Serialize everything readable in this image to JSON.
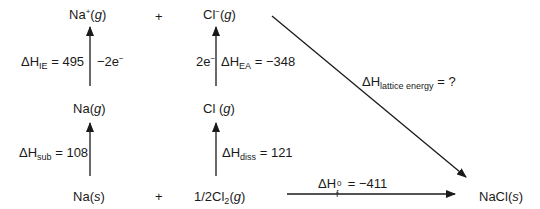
{
  "species": {
    "na_plus_g": {
      "base": "Na",
      "sup": "+",
      "state": "g"
    },
    "cl_minus_g": {
      "base": "Cl",
      "sup": "−",
      "state": "g"
    },
    "na_g": {
      "base": "Na",
      "state": "g"
    },
    "cl_g": {
      "base": "Cl ",
      "state": "g"
    },
    "na_s": {
      "base": "Na",
      "state": "s"
    },
    "half_cl2_g": {
      "base": "1/2Cl",
      "sub": "2",
      "state": "g"
    },
    "nacl_s": {
      "base": "NaCl",
      "state": "s"
    }
  },
  "plus_signs": [
    "+",
    "+"
  ],
  "steps": {
    "ionization": {
      "symbol": "ΔH",
      "sub": "IE",
      "eq": " = 495",
      "electron": "−2e",
      "electron_sup": "−"
    },
    "electron_affinity": {
      "symbol": "ΔH",
      "sub": "EA",
      "eq": " = −348",
      "electron": "2e",
      "electron_sup": "−"
    },
    "sublimation": {
      "symbol": "ΔH",
      "sub": "sub",
      "eq": " = 108"
    },
    "dissociation": {
      "symbol": "ΔH",
      "sub": "diss",
      "eq": " = 121"
    },
    "lattice": {
      "symbol": "ΔH",
      "sub": "lattice energy",
      "eq": " = ?"
    },
    "formation": {
      "symbol": "ΔH",
      "sub": "f",
      "sup": "0",
      "eq": " = −411"
    }
  }
}
